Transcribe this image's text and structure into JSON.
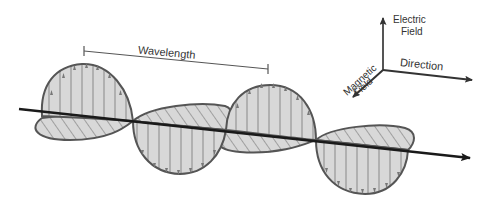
{
  "labels": {
    "wavelength": "Wavelength",
    "electric_field_line1": "Electric",
    "electric_field_line2": "Field",
    "magnetic_field_line1": "Magnetic",
    "magnetic_field_line2": "Field",
    "direction": "Direction"
  },
  "colors": {
    "outline": "#555555",
    "fill": "#d8d8d8",
    "axis": "#1a1a1a",
    "text": "#333333",
    "vector": "#7a7a7a"
  }
}
